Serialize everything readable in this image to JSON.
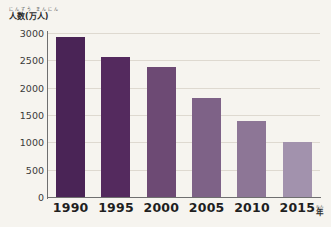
{
  "chart_data": {
    "type": "bar",
    "title": "",
    "ylabel": "人数(万人)",
    "ylabel_ruby": "にんずう まんにん",
    "xlabel": "年",
    "xlabel_ruby": "ねん",
    "categories": [
      "1990",
      "1995",
      "2000",
      "2005",
      "2010",
      "2015"
    ],
    "values": [
      2920,
      2560,
      2380,
      1810,
      1390,
      1000
    ],
    "series": [
      {
        "name": "人数(万人)",
        "values": [
          2920,
          2560,
          2380,
          1810,
          1390,
          1000
        ]
      }
    ],
    "ylim": [
      0,
      3000
    ],
    "yticks": [
      "0",
      "500",
      "1000",
      "1500",
      "2000",
      "2500",
      "3000"
    ],
    "ytick_values": [
      0,
      500,
      1000,
      1500,
      2000,
      2500,
      3000
    ],
    "grid": true,
    "legend": "none",
    "bar_colors": [
      "#4a2456",
      "#542a5e",
      "#6d4a74",
      "#7e6287",
      "#8d7696",
      "#a292ad"
    ],
    "background_color": "#f6f4ef",
    "axis_color": "#6f6f6f",
    "grid_color": "#ded9d0"
  }
}
